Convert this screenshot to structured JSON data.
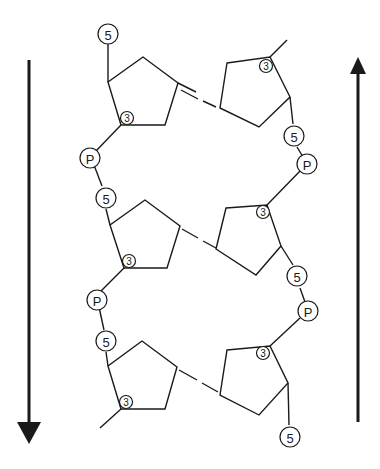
{
  "diagram": {
    "colors": {
      "stroke": "#1a1a1a",
      "background": "#ffffff"
    },
    "left_strand": {
      "direction": "down",
      "arrow": "down-arrow",
      "labels": {
        "five_top": "5",
        "sugar1_three": "3",
        "p1": "P",
        "sugar2_five": "5",
        "sugar2_three": "3",
        "p2": "P",
        "sugar3_five": "5",
        "sugar3_three": "3"
      }
    },
    "right_strand": {
      "direction": "up",
      "arrow": "up-arrow",
      "labels": {
        "sugar1_three": "3",
        "sugar1_five": "5",
        "p1": "P",
        "sugar2_three": "3",
        "sugar2_five": "5",
        "p2": "P",
        "sugar3_three": "3",
        "five_bottom": "5"
      }
    },
    "base_pairs": 3
  }
}
